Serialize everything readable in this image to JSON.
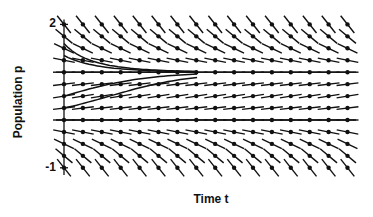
{
  "chart_data": {
    "type": "direction_field",
    "title": "",
    "xlabel": "Time t",
    "ylabel": "Population p",
    "equation_implied": "dp/dt = p(1 - p)",
    "y_ticks": [
      {
        "value": 2,
        "label": "2"
      },
      {
        "value": -1,
        "label": "-1"
      }
    ],
    "ylim": [
      -1,
      2
    ],
    "grid": false,
    "columns": 16,
    "row_values": [
      2.0,
      1.75,
      1.5,
      1.25,
      1.0,
      0.75,
      0.5,
      0.25,
      0.0,
      -0.25,
      -0.5,
      -0.75,
      -1.0
    ],
    "equilibrium_lines": [
      1,
      0
    ],
    "solution_curves": [
      {
        "p0": 1.6
      },
      {
        "p0": 1.35
      },
      {
        "p0": 0.5
      },
      {
        "p0": 0.25
      }
    ],
    "colors": {
      "ink": "#111111",
      "background": "#ffffff"
    }
  },
  "layout": {
    "axis_x": 64,
    "x_step": 18.9,
    "x_end": 356,
    "y_of_p0": 120,
    "px_per_unit": 47.8,
    "t_per_col": 0.25
  }
}
